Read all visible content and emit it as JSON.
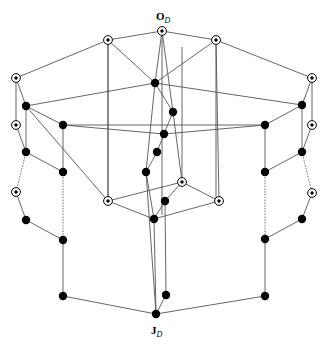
{
  "figure": {
    "kind": "hasse-diagram",
    "title": "",
    "background_color": "#ffffff",
    "width": 329,
    "height": 347
  },
  "labels": {
    "top": {
      "text": "O",
      "subscript": "D",
      "x": 156,
      "y": 20
    },
    "bottom": {
      "text": "J",
      "subscript": "D",
      "x": 151,
      "y": 334
    }
  },
  "style": {
    "edge_color": "#555555",
    "dotted_edge_color": "#777777",
    "node_color": "#000000",
    "ring_fill": "#ffffff",
    "filled_radius": 4.2,
    "ring_outer_radius": 4.4,
    "ring_inner_radius": 1.7
  },
  "nodes": [
    {
      "id": "top",
      "x": 162,
      "y": 31,
      "type": "circled",
      "name": "node-top-O"
    },
    {
      "id": "a1",
      "x": 108,
      "y": 40,
      "type": "circled",
      "name": "node-upper-left"
    },
    {
      "id": "a2",
      "x": 216,
      "y": 40,
      "type": "circled",
      "name": "node-upper-right"
    },
    {
      "id": "L1",
      "x": 16,
      "y": 78,
      "type": "circled",
      "name": "node-left-outer-1"
    },
    {
      "id": "R1",
      "x": 312,
      "y": 78,
      "type": "circled",
      "name": "node-right-outer-1"
    },
    {
      "id": "c1",
      "x": 155,
      "y": 83,
      "type": "filled",
      "name": "node-center-1"
    },
    {
      "id": "L2",
      "x": 26,
      "y": 106,
      "type": "filled",
      "name": "node-left-outer-2"
    },
    {
      "id": "R2",
      "x": 302,
      "y": 105,
      "type": "filled",
      "name": "node-right-outer-2"
    },
    {
      "id": "c2",
      "x": 173,
      "y": 112,
      "type": "filled",
      "name": "node-center-2"
    },
    {
      "id": "L3",
      "x": 16,
      "y": 125,
      "type": "circled",
      "name": "node-left-outer-3"
    },
    {
      "id": "R3",
      "x": 312,
      "y": 125,
      "type": "circled",
      "name": "node-right-outer-3"
    },
    {
      "id": "IL1",
      "x": 63,
      "y": 125,
      "type": "filled",
      "name": "node-inner-left-1"
    },
    {
      "id": "IR1",
      "x": 265,
      "y": 125,
      "type": "filled",
      "name": "node-inner-right-1"
    },
    {
      "id": "c3",
      "x": 164,
      "y": 134,
      "type": "filled",
      "name": "node-center-3"
    },
    {
      "id": "L4",
      "x": 26,
      "y": 152,
      "type": "filled",
      "name": "node-left-outer-4"
    },
    {
      "id": "R4",
      "x": 302,
      "y": 152,
      "type": "filled",
      "name": "node-right-outer-4"
    },
    {
      "id": "c4",
      "x": 157,
      "y": 152,
      "type": "filled",
      "name": "node-center-4"
    },
    {
      "id": "IL2",
      "x": 63,
      "y": 172,
      "type": "filled",
      "name": "node-inner-left-2"
    },
    {
      "id": "IR2",
      "x": 265,
      "y": 172,
      "type": "filled",
      "name": "node-inner-right-2"
    },
    {
      "id": "c5",
      "x": 146,
      "y": 172,
      "type": "filled",
      "name": "node-center-5"
    },
    {
      "id": "bx_t",
      "x": 182,
      "y": 182,
      "type": "circled",
      "name": "node-innerbox-top"
    },
    {
      "id": "L5",
      "x": 16,
      "y": 192,
      "type": "circled",
      "name": "node-left-outer-5"
    },
    {
      "id": "R5",
      "x": 312,
      "y": 193,
      "type": "circled",
      "name": "node-right-outer-5"
    },
    {
      "id": "bx_l",
      "x": 108,
      "y": 201,
      "type": "circled",
      "name": "node-innerbox-left"
    },
    {
      "id": "bx_r",
      "x": 219,
      "y": 201,
      "type": "circled",
      "name": "node-innerbox-right"
    },
    {
      "id": "bx_c",
      "x": 165,
      "y": 201,
      "type": "filled",
      "name": "node-innerbox-center"
    },
    {
      "id": "bx_b",
      "x": 154,
      "y": 219,
      "type": "filled",
      "name": "node-innerbox-bottom"
    },
    {
      "id": "L6",
      "x": 26,
      "y": 220,
      "type": "filled",
      "name": "node-left-outer-6"
    },
    {
      "id": "R6",
      "x": 302,
      "y": 219,
      "type": "filled",
      "name": "node-right-outer-6"
    },
    {
      "id": "IL3",
      "x": 63,
      "y": 240,
      "type": "filled",
      "name": "node-inner-left-3"
    },
    {
      "id": "IR3",
      "x": 265,
      "y": 239,
      "type": "filled",
      "name": "node-inner-right-3"
    },
    {
      "id": "IL4",
      "x": 63,
      "y": 296,
      "type": "filled",
      "name": "node-inner-left-4"
    },
    {
      "id": "IR4",
      "x": 265,
      "y": 296,
      "type": "filled",
      "name": "node-inner-right-4"
    },
    {
      "id": "bc",
      "x": 166,
      "y": 295,
      "type": "filled",
      "name": "node-bottom-center-upper"
    },
    {
      "id": "bot",
      "x": 156,
      "y": 314,
      "type": "filled",
      "name": "node-bottom-J"
    }
  ],
  "edges": [
    {
      "from": "top",
      "to": "a1",
      "style": "solid"
    },
    {
      "from": "top",
      "to": "a2",
      "style": "solid"
    },
    {
      "from": "top",
      "to": "c1",
      "style": "solid"
    },
    {
      "from": "a1",
      "to": "L1",
      "style": "solid"
    },
    {
      "from": "a2",
      "to": "R1",
      "style": "solid"
    },
    {
      "from": "a1",
      "to": "c1",
      "style": "solid"
    },
    {
      "from": "a2",
      "to": "c1",
      "style": "solid"
    },
    {
      "from": "top",
      "to": "c2",
      "style": "solid"
    },
    {
      "from": "a1",
      "to": "bx_l",
      "style": "solid"
    },
    {
      "from": "a2",
      "to": "bx_r",
      "style": "solid"
    },
    {
      "from": "L1",
      "to": "L2",
      "style": "solid"
    },
    {
      "from": "L1",
      "to": "L3",
      "style": "solid"
    },
    {
      "from": "R1",
      "to": "R2",
      "style": "solid"
    },
    {
      "from": "R1",
      "to": "R3",
      "style": "solid"
    },
    {
      "from": "c1",
      "to": "L2",
      "style": "solid"
    },
    {
      "from": "c1",
      "to": "R2",
      "style": "solid"
    },
    {
      "from": "c1",
      "to": "c2",
      "style": "solid"
    },
    {
      "from": "c1",
      "to": "c5",
      "style": "solid"
    },
    {
      "from": "L2",
      "to": "IL1",
      "style": "solid"
    },
    {
      "from": "R2",
      "to": "IR1",
      "style": "solid"
    },
    {
      "from": "L2",
      "to": "L4",
      "style": "solid"
    },
    {
      "from": "R2",
      "to": "R4",
      "style": "solid"
    },
    {
      "from": "L3",
      "to": "L4",
      "style": "solid"
    },
    {
      "from": "R3",
      "to": "R4",
      "style": "solid"
    },
    {
      "from": "IL1",
      "to": "IR1",
      "style": "solid"
    },
    {
      "from": "IL1",
      "to": "c3",
      "style": "solid"
    },
    {
      "from": "IR1",
      "to": "c3",
      "style": "solid"
    },
    {
      "from": "c2",
      "to": "c3",
      "style": "solid"
    },
    {
      "from": "c3",
      "to": "c4",
      "style": "solid"
    },
    {
      "from": "c4",
      "to": "c5",
      "style": "solid"
    },
    {
      "from": "IL1",
      "to": "IL2",
      "style": "solid"
    },
    {
      "from": "IR1",
      "to": "IR2",
      "style": "solid"
    },
    {
      "from": "L4",
      "to": "IL2",
      "style": "solid"
    },
    {
      "from": "R4",
      "to": "IR2",
      "style": "solid"
    },
    {
      "from": "L4",
      "to": "L5",
      "style": "dotted"
    },
    {
      "from": "R4",
      "to": "R5",
      "style": "dotted"
    },
    {
      "from": "IL2",
      "to": "IL3",
      "style": "dotted"
    },
    {
      "from": "IR2",
      "to": "IR3",
      "style": "dotted"
    },
    {
      "from": "c5",
      "to": "bot",
      "style": "solid"
    },
    {
      "from": "c5",
      "to": "bx_b",
      "style": "solid"
    },
    {
      "from": "bx_l",
      "to": "bx_t",
      "style": "solid"
    },
    {
      "from": "bx_t",
      "to": "bx_r",
      "style": "solid"
    },
    {
      "from": "bx_l",
      "to": "bx_b",
      "style": "solid"
    },
    {
      "from": "bx_r",
      "to": "bx_b",
      "style": "solid"
    },
    {
      "from": "bx_t",
      "to": "bx_c",
      "style": "solid"
    },
    {
      "from": "bx_c",
      "to": "bx_b",
      "style": "solid"
    },
    {
      "from": "L5",
      "to": "L6",
      "style": "solid"
    },
    {
      "from": "R5",
      "to": "R6",
      "style": "solid"
    },
    {
      "from": "L6",
      "to": "IL3",
      "style": "solid"
    },
    {
      "from": "R6",
      "to": "IR3",
      "style": "solid"
    },
    {
      "from": "IL3",
      "to": "IL4",
      "style": "solid"
    },
    {
      "from": "IR3",
      "to": "IR4",
      "style": "solid"
    },
    {
      "from": "IL4",
      "to": "bot",
      "style": "solid"
    },
    {
      "from": "IR4",
      "to": "bot",
      "style": "solid"
    },
    {
      "from": "bc",
      "to": "bot",
      "style": "solid"
    },
    {
      "from": "bx_b",
      "to": "bot",
      "style": "solid"
    },
    {
      "from": "bx_c",
      "to": "bc",
      "style": "solid"
    },
    {
      "from": "c2",
      "to": "bx_t",
      "style": "solid"
    },
    {
      "from": "bx_l",
      "to": "L2",
      "style": "solid"
    }
  ],
  "vertical_rails": [
    {
      "name": "rail-left-a1",
      "x": 108,
      "y1": 40,
      "y2": 201
    },
    {
      "name": "rail-right-a2",
      "x": 216,
      "y1": 40,
      "y2": 201
    },
    {
      "name": "rail-center-top",
      "x": 162,
      "y1": 31,
      "y2": 215
    },
    {
      "name": "rail-center-b",
      "x": 182,
      "y1": 47,
      "y2": 182
    }
  ]
}
